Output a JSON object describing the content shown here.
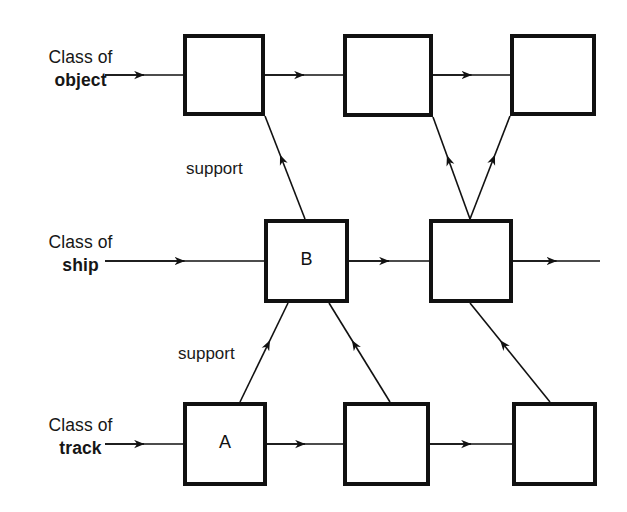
{
  "diagram": {
    "background_color": "#ffffff",
    "stroke_color": "#111111",
    "box_fill": "#ffffff",
    "box_border_width": 4,
    "connector_width": 1.6,
    "rows": [
      {
        "id": "object",
        "label_line1": "Class of",
        "label_line2": "object",
        "label_x": 28,
        "label_y": 46,
        "label_width": 105,
        "y": 34,
        "boxes": [
          {
            "id": "object-1",
            "text": "",
            "x": 183,
            "y": 34,
            "w": 82,
            "h": 82
          },
          {
            "id": "object-2",
            "text": "",
            "x": 343,
            "y": 34,
            "w": 90,
            "h": 83
          },
          {
            "id": "object-3",
            "text": "",
            "x": 510,
            "y": 34,
            "w": 86,
            "h": 82
          }
        ]
      },
      {
        "id": "ship",
        "label_line1": "Class of",
        "label_line2": "ship",
        "label_x": 28,
        "label_y": 231,
        "label_width": 105,
        "y": 219,
        "boxes": [
          {
            "id": "ship-1",
            "text": "B",
            "x": 264,
            "y": 219,
            "w": 85,
            "h": 84
          },
          {
            "id": "ship-2",
            "text": "",
            "x": 429,
            "y": 219,
            "w": 84,
            "h": 84
          }
        ]
      },
      {
        "id": "track",
        "label_line1": "Class of",
        "label_line2": "track",
        "label_x": 28,
        "label_y": 414,
        "label_width": 105,
        "y": 402,
        "boxes": [
          {
            "id": "track-1",
            "text": "A",
            "x": 183,
            "y": 402,
            "w": 84,
            "h": 84
          },
          {
            "id": "track-2",
            "text": "",
            "x": 343,
            "y": 402,
            "w": 87,
            "h": 84
          },
          {
            "id": "track-3",
            "text": "",
            "x": 512,
            "y": 402,
            "w": 85,
            "h": 84
          }
        ]
      }
    ],
    "edge_labels": [
      {
        "id": "support-upper",
        "text": "support",
        "x": 186,
        "y": 159
      },
      {
        "id": "support-lower",
        "text": "support",
        "x": 178,
        "y": 344
      }
    ],
    "horizontal_flows": [
      {
        "id": "flow-object-in",
        "x1": 105,
        "y1": 75,
        "x2": 183,
        "y2": 75
      },
      {
        "id": "flow-object-1-2",
        "x1": 265,
        "y1": 75,
        "x2": 343,
        "y2": 75
      },
      {
        "id": "flow-object-2-3",
        "x1": 433,
        "y1": 75,
        "x2": 510,
        "y2": 75
      },
      {
        "id": "flow-ship-in",
        "x1": 105,
        "y1": 261,
        "x2": 264,
        "y2": 261
      },
      {
        "id": "flow-ship-1-2",
        "x1": 349,
        "y1": 261,
        "x2": 429,
        "y2": 261
      },
      {
        "id": "flow-ship-out",
        "x1": 513,
        "y1": 261,
        "x2": 600,
        "y2": 261
      },
      {
        "id": "flow-track-in",
        "x1": 105,
        "y1": 444,
        "x2": 183,
        "y2": 444
      },
      {
        "id": "flow-track-1-2",
        "x1": 267,
        "y1": 444,
        "x2": 343,
        "y2": 444
      },
      {
        "id": "flow-track-2-3",
        "x1": 430,
        "y1": 444,
        "x2": 512,
        "y2": 444
      }
    ],
    "support_links": [
      {
        "id": "support-ship1-to-object1",
        "from": "ship-1",
        "to": "object-1",
        "x1": 305,
        "y1": 219,
        "x2": 265,
        "y2": 116
      },
      {
        "id": "support-ship2-to-object2",
        "from": "ship-2",
        "to": "object-2",
        "x1": 470,
        "y1": 219,
        "x2": 433,
        "y2": 117
      },
      {
        "id": "support-ship2-to-object3",
        "from": "ship-2",
        "to": "object-3",
        "x1": 470,
        "y1": 219,
        "x2": 510,
        "y2": 116
      },
      {
        "id": "support-track1-to-ship1",
        "from": "track-1",
        "to": "ship-1",
        "x1": 240,
        "y1": 402,
        "x2": 288,
        "y2": 303
      },
      {
        "id": "support-track2-to-ship1",
        "from": "track-2",
        "to": "ship-1",
        "x1": 390,
        "y1": 402,
        "x2": 329,
        "y2": 303
      },
      {
        "id": "support-track3-to-ship2",
        "from": "track-3",
        "to": "ship-2",
        "x1": 550,
        "y1": 402,
        "x2": 470,
        "y2": 303
      }
    ]
  }
}
